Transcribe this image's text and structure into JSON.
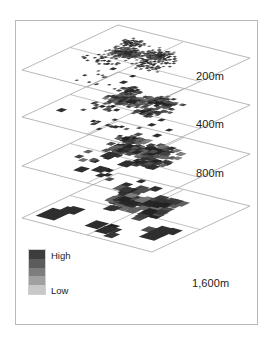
{
  "figure": {
    "title": "",
    "background": "#ffffff",
    "frame_color": "#b9b9b9",
    "plane_outline_color": "#9a9a9a"
  },
  "labels": {
    "layer_1": "200m",
    "layer_2": "400m",
    "layer_3": "800m",
    "layer_4": "1,600m"
  },
  "legend": {
    "high_label": "High",
    "low_label": "Low",
    "swatches": [
      "#3d3d3d",
      "#5c5c5c",
      "#7d7d7d",
      "#a0a0a0",
      "#c8c8c8"
    ]
  },
  "chart_data": {
    "type": "heatmap",
    "xlabel": "",
    "ylabel": "",
    "legend_position": "bottom-left",
    "grid": true,
    "colorscale": {
      "name": "grayscale",
      "low": "#d8d8d8",
      "high": "#2a2a2a",
      "low_label": "Low",
      "high_label": "High"
    },
    "layers": [
      {
        "name": "200m",
        "cell_size_m": 200,
        "cell_px": 2.0,
        "point_count": 520,
        "origin": {
          "x": 22,
          "y": 70
        },
        "top": {
          "x": 118,
          "y": 25
        },
        "right": {
          "x": 250,
          "y": 58
        },
        "bottom": {
          "x": 152,
          "y": 104
        }
      },
      {
        "name": "400m",
        "cell_size_m": 400,
        "cell_px": 3.0,
        "point_count": 380,
        "origin": {
          "x": 22,
          "y": 117
        },
        "top": {
          "x": 118,
          "y": 72
        },
        "right": {
          "x": 250,
          "y": 105
        },
        "bottom": {
          "x": 152,
          "y": 151
        }
      },
      {
        "name": "800m",
        "cell_size_m": 800,
        "cell_px": 4.6,
        "point_count": 260,
        "origin": {
          "x": 22,
          "y": 166
        },
        "top": {
          "x": 118,
          "y": 121
        },
        "right": {
          "x": 250,
          "y": 154
        },
        "bottom": {
          "x": 152,
          "y": 200
        }
      },
      {
        "name": "1,600m",
        "cell_size_m": 1600,
        "cell_px": 7.4,
        "point_count": 150,
        "origin": {
          "x": 22,
          "y": 218
        },
        "top": {
          "x": 118,
          "y": 173
        },
        "right": {
          "x": 250,
          "y": 206
        },
        "bottom": {
          "x": 152,
          "y": 252
        }
      }
    ]
  }
}
